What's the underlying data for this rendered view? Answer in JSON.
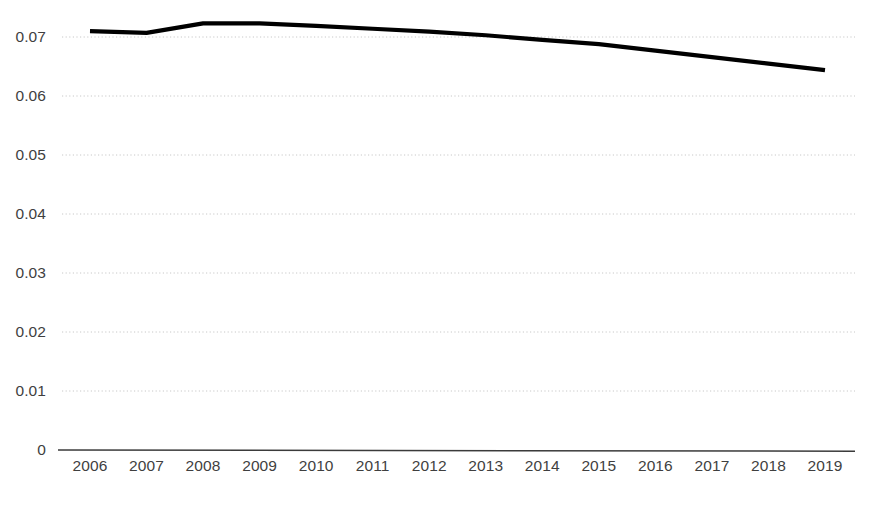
{
  "chart_data": {
    "type": "line",
    "title": "",
    "subtitle": "",
    "xlabel": "",
    "ylabel": "",
    "categories": [
      "2006",
      "2007",
      "2008",
      "2009",
      "2010",
      "2011",
      "2012",
      "2013",
      "2014",
      "2015",
      "2016",
      "2017",
      "2018",
      "2019"
    ],
    "series": [
      {
        "name": "series-1",
        "color": "#000000",
        "values": [
          0.071,
          0.0707,
          0.0723,
          0.0723,
          0.0719,
          0.0714,
          0.0709,
          0.0703,
          0.0695,
          0.0688,
          0.0677,
          0.0666,
          0.0655,
          0.0644
        ]
      }
    ],
    "ylim": [
      0,
      0.0745
    ],
    "y_ticks": [
      0,
      0.01,
      0.02,
      0.03,
      0.04,
      0.05,
      0.06,
      0.07
    ],
    "y_tick_labels": [
      "0",
      "0.01",
      "0.02",
      "0.03",
      "0.04",
      "0.05",
      "0.06",
      "0.07"
    ],
    "x_tick_labels": [
      "2006",
      "2007",
      "2008",
      "2009",
      "2010",
      "2011",
      "2012",
      "2013",
      "2014",
      "2015",
      "2016",
      "2017",
      "2018",
      "2019"
    ],
    "grid": {
      "horizontal": true,
      "vertical": false,
      "style": "dotted",
      "color": "#c8c8c8"
    },
    "legend": {
      "visible": false,
      "position": "none",
      "entries": []
    },
    "axis": {
      "x_axis_line_color": "#3b3b3b",
      "y_axis_line": false
    }
  },
  "colors": {
    "line": "#101010",
    "grid": "#c9c9c9",
    "axis": "#3d3d3d",
    "text": "#3f3f3f",
    "background": "#ffffff"
  }
}
